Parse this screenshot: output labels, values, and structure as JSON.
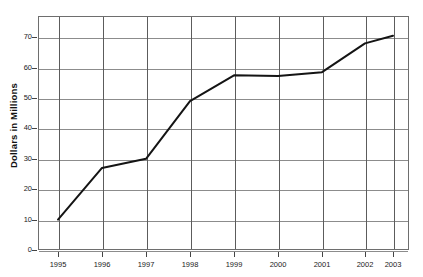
{
  "chart_data": {
    "type": "line",
    "title": "",
    "subtitle": "",
    "xlabel": "",
    "ylabel": "Dollars in Millions",
    "categories": [
      "1995",
      "1996",
      "1997",
      "1998",
      "1999",
      "2000",
      "2001",
      "2002",
      "2003"
    ],
    "x": [
      1995,
      1996,
      1997,
      1998,
      1999,
      2000,
      2001,
      2002,
      2003
    ],
    "values": [
      10,
      27,
      30,
      49,
      57.5,
      57.3,
      58.5,
      68,
      70.5
    ],
    "series": [
      {
        "name": "",
        "values": [
          10,
          27,
          30,
          49,
          57.5,
          57.3,
          58.5,
          68,
          70.5
        ]
      }
    ],
    "ylim": [
      0,
      77
    ],
    "xlim": [
      "1995",
      "2003"
    ],
    "ytick_labels": [
      "0",
      "10",
      "20",
      "30",
      "40",
      "50",
      "60",
      "70"
    ],
    "ytick_values": [
      0,
      10,
      20,
      30,
      40,
      50,
      60,
      70
    ],
    "xtick_labels": [
      "1995",
      "1996",
      "1997",
      "1998",
      "1999",
      "2000",
      "2001",
      "2002",
      "2003"
    ],
    "grid": "both",
    "legend": "none",
    "line_color": "#141414",
    "grid_color": "#8c8c8c",
    "frame_color": "#6e6e6e",
    "background_color": "#ffffff",
    "markers": "none"
  }
}
